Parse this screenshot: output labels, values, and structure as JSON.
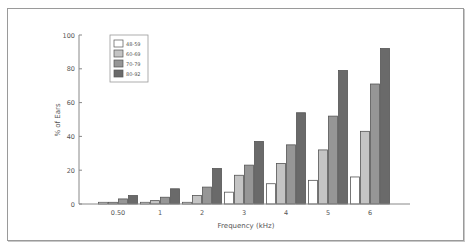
{
  "chart_data": {
    "type": "bar",
    "title": "",
    "xlabel": "Frequency (kHz)",
    "ylabel": "% of Ears",
    "ylim": [
      0,
      100
    ],
    "yticks": [
      0,
      20,
      40,
      60,
      80,
      100
    ],
    "grid": false,
    "legend_position": "upper-left",
    "categories": [
      "0.50",
      "1",
      "2",
      "3",
      "4",
      "5",
      "6"
    ],
    "series": [
      {
        "name": "48-59",
        "color": "#ffffff",
        "values": [
          1,
          1,
          1,
          7,
          12,
          14,
          16
        ]
      },
      {
        "name": "60-69",
        "color": "#c4c4c4",
        "values": [
          1,
          2,
          5,
          17,
          24,
          32,
          43
        ]
      },
      {
        "name": "70-79",
        "color": "#969696",
        "values": [
          3,
          4,
          10,
          23,
          35,
          52,
          71
        ]
      },
      {
        "name": "80-92",
        "color": "#6a6a6a",
        "values": [
          5,
          9,
          21,
          37,
          54,
          79,
          92
        ]
      }
    ]
  }
}
